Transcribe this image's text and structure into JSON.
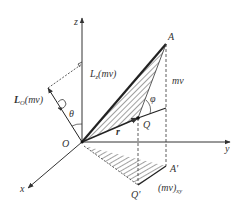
{
  "diagram": {
    "axes": {
      "x": "x",
      "y": "y",
      "z": "z"
    },
    "points": {
      "origin": "O",
      "A": "A",
      "A_proj": "A'",
      "Q": "Q",
      "Q_proj": "Q'"
    },
    "vectors": {
      "r": "r",
      "mv": "mv",
      "mv_xy_main": "(mv)",
      "mv_xy_sub": "xy"
    },
    "moments": {
      "Lz_main": "L",
      "Lz_sub": "z",
      "Lz_rest": "(mv)",
      "LO_main": "L",
      "LO_sub": "O",
      "LO_rest": "(mv)"
    },
    "angles": {
      "theta": "θ",
      "phi": "φ"
    },
    "colors": {
      "line": "#333333",
      "hatch": "#444444",
      "background": "#ffffff"
    }
  }
}
